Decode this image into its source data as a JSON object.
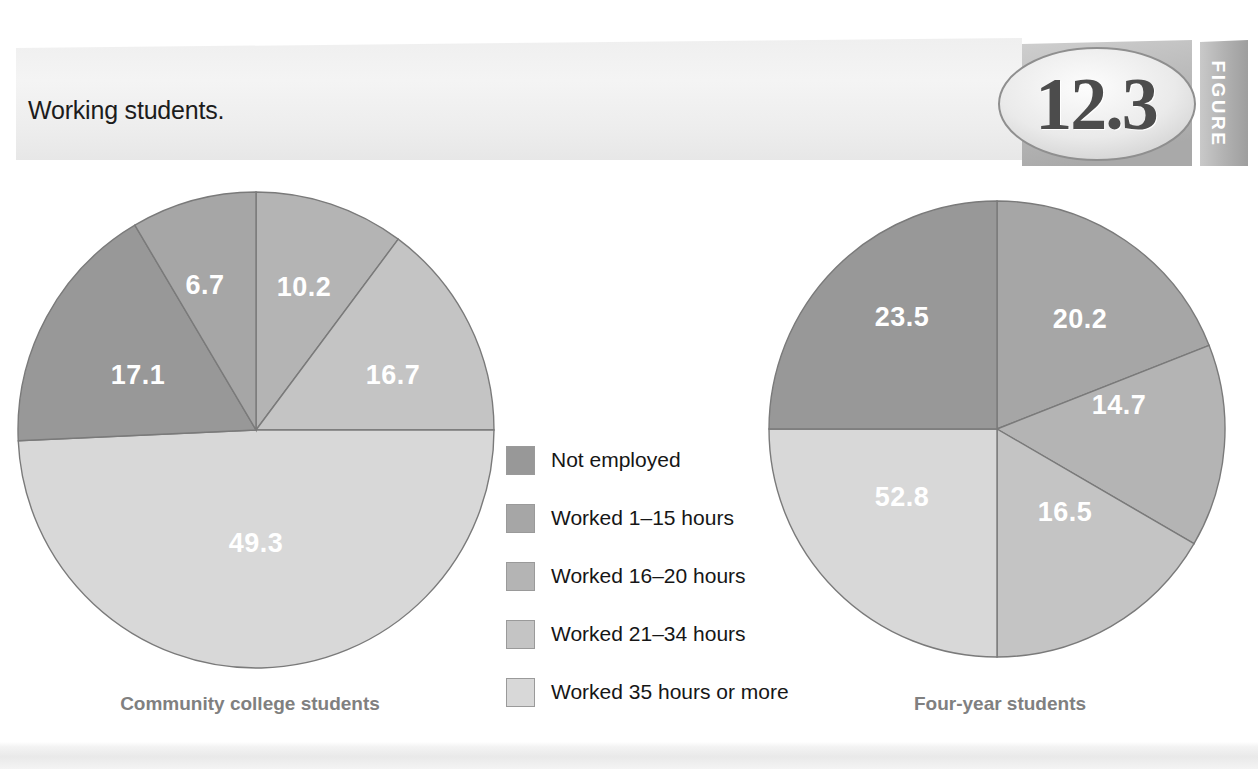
{
  "header": {
    "title": "Working students.",
    "figure_number": "12.3",
    "figure_word": "FIGURE"
  },
  "legend": {
    "items": [
      {
        "label": "Not employed",
        "color": "#989898"
      },
      {
        "label": "Worked 1–15 hours",
        "color": "#a6a6a6"
      },
      {
        "label": "Worked 16–20 hours",
        "color": "#b4b4b4"
      },
      {
        "label": "Worked 21–34 hours",
        "color": "#c4c4c4"
      },
      {
        "label": "Worked 35 hours or more",
        "color": "#d8d8d8"
      }
    ]
  },
  "chart_data": {
    "type": "pie",
    "title": "Working students.",
    "legend_position": "center",
    "categories": [
      "Not employed",
      "Worked 1–15 hours",
      "Worked 16–20 hours",
      "Worked 21–34 hours",
      "Worked 35 hours or more"
    ],
    "colors": [
      "#989898",
      "#a6a6a6",
      "#b4b4b4",
      "#c4c4c4",
      "#d8d8d8"
    ],
    "series": [
      {
        "name": "Community college students",
        "caption": "Community college students",
        "values": [
          17.1,
          6.7,
          10.2,
          16.7,
          49.3
        ],
        "labels": [
          "17.1",
          "6.7",
          "10.2",
          "16.7",
          "49.3"
        ]
      },
      {
        "name": "Four-year students",
        "caption": "Four-year students",
        "values": [
          23.5,
          20.2,
          14.7,
          16.5,
          52.8
        ],
        "labels": [
          "23.5",
          "20.2",
          "14.7",
          "16.5",
          "52.8"
        ]
      }
    ]
  },
  "pies": {
    "left": {
      "caption": "Community college students",
      "slices": [
        {
          "label": "10.2",
          "value": 10.2,
          "color": "#b4b4b4",
          "start": 0,
          "end": 36.7,
          "lx": 296,
          "ly": 102
        },
        {
          "label": "16.7",
          "value": 16.7,
          "color": "#c4c4c4",
          "start": 36.7,
          "end": 90,
          "lx": 385,
          "ly": 190
        },
        {
          "label": "49.3",
          "value": 49.3,
          "color": "#d8d8d8",
          "start": 90,
          "end": 267.4,
          "lx": 248,
          "ly": 358
        },
        {
          "label": "17.1",
          "value": 17.1,
          "color": "#989898",
          "start": 267.4,
          "end": 329.4,
          "lx": 130,
          "ly": 190
        },
        {
          "label": "6.7",
          "value": 6.7,
          "color": "#a6a6a6",
          "start": 329.4,
          "end": 360,
          "lx": 197,
          "ly": 100
        }
      ]
    },
    "right": {
      "caption": "Four-year students",
      "slices": [
        {
          "label": "20.2",
          "value": 20.2,
          "color": "#a6a6a6",
          "start": 0,
          "end": 68.5,
          "lx": 318,
          "ly": 122
        },
        {
          "label": "14.7",
          "value": 14.7,
          "color": "#b4b4b4",
          "start": 68.5,
          "end": 120.2,
          "lx": 357,
          "ly": 208
        },
        {
          "label": "16.5",
          "value": 16.5,
          "color": "#c4c4c4",
          "start": 120.2,
          "end": 180,
          "lx": 303,
          "ly": 315
        },
        {
          "label": "52.8",
          "value": 52.8,
          "color": "#d8d8d8",
          "start": 180,
          "end": 270,
          "lx": 140,
          "ly": 300
        },
        {
          "label": "23.5",
          "value": 23.5,
          "color": "#989898",
          "start": 270,
          "end": 360,
          "lx": 140,
          "ly": 120
        }
      ]
    }
  },
  "footer": {
    "band": ""
  }
}
